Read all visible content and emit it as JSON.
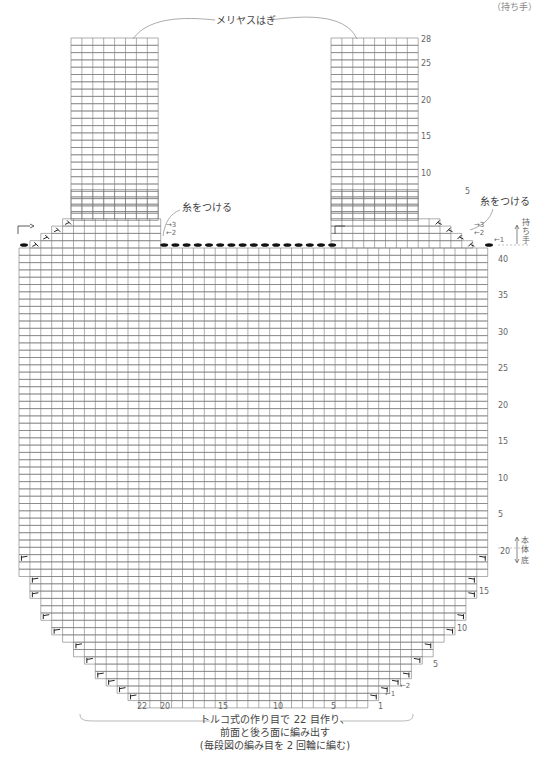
{
  "corner_label": "（持ち手）",
  "grid": {
    "cell_w": 10.9,
    "row_h": 7.3,
    "line_color": "#777777",
    "body_left": 19,
    "body_cols": 43,
    "body_top_y": 248,
    "body_rows": 42,
    "strap_cols": 8,
    "strap_rows": 28,
    "left_strap_x": 71,
    "right_strap_x": 331,
    "strap_top_y": 38,
    "handle_step_rows": 4,
    "bottom_rows": 20,
    "bottom_end_cols": 22
  },
  "labels": {
    "joining": "メリヤスはぎ",
    "attach_yarn_left": "糸をつける",
    "attach_yarn_right": "糸をつける",
    "handle_section": "持ち手",
    "body_section": "本体",
    "bottom_section": "底",
    "caption_line1": "トルコ式の作り目で 22 目作り、",
    "caption_line2": "前面と後ろ面に編み出す",
    "caption_line3": "(毎段図の編み目を 2 回輪に編む)"
  },
  "strap_row_numbers": [
    "28",
    "25",
    "20",
    "15",
    "10",
    "5"
  ],
  "handle_row_arrows": [
    "←1",
    "←2",
    "→3"
  ],
  "body_row_numbers": [
    "40",
    "35",
    "30",
    "25",
    "20",
    "15",
    "10",
    "5"
  ],
  "bottom_row_numbers": [
    "20",
    "15",
    "10",
    "5",
    "←2",
    "←1"
  ],
  "bottom_col_numbers": [
    "22",
    "20",
    "15",
    "10",
    "5",
    "1"
  ],
  "symbols": {
    "decrease": "knit-2-together-icon",
    "bind_off": "bind-off-oval-icon",
    "direction": "turn-arrow-icon"
  }
}
